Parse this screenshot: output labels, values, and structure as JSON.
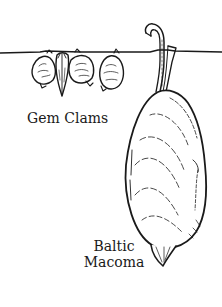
{
  "figure": {
    "labels": {
      "gem_clams": "Gem Clams",
      "baltic_macoma_line1": "Baltic",
      "baltic_macoma_line2": "Macoma"
    },
    "colors": {
      "ink": "#1a1a1a",
      "background": "#ffffff"
    }
  }
}
